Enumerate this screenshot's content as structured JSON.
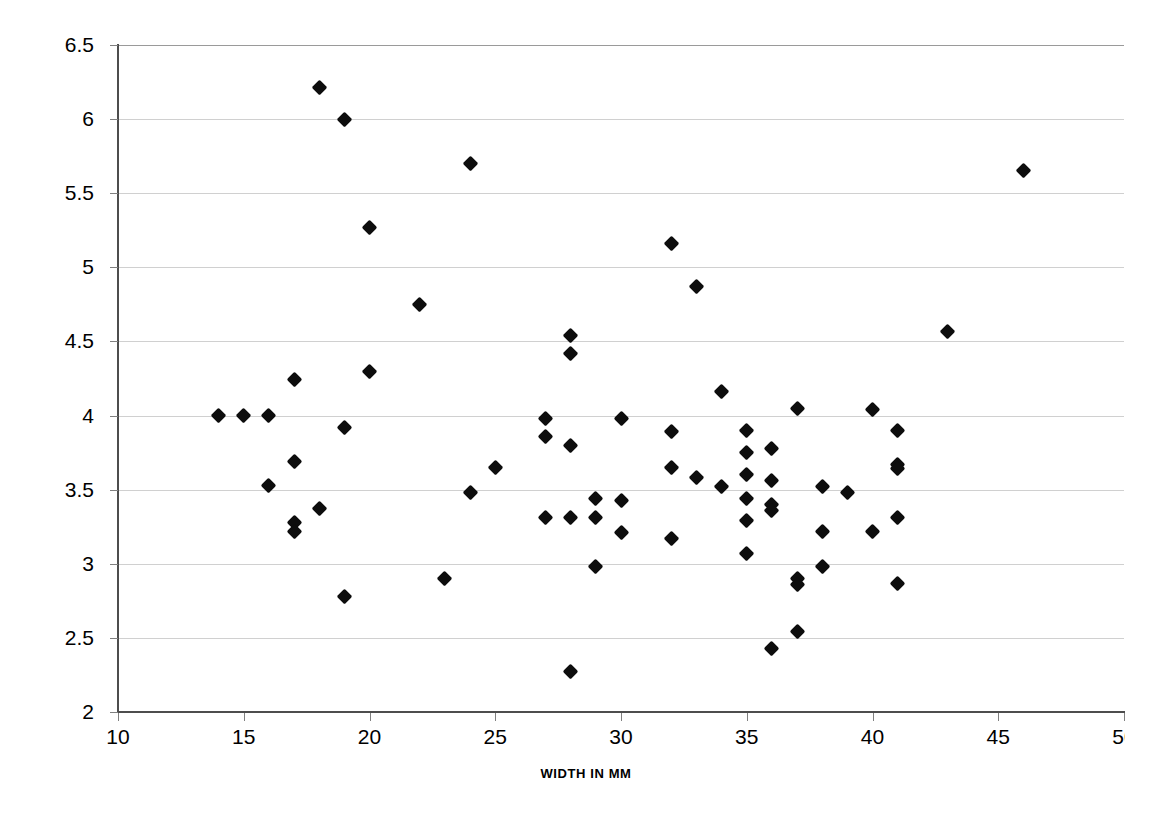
{
  "chart_data": {
    "type": "scatter",
    "title": "",
    "xlabel": "WIDTH IN MM",
    "ylabel": "L/TH RATIO",
    "xlim": [
      10,
      50
    ],
    "ylim": [
      2,
      6.5
    ],
    "xticks": [
      10,
      15,
      20,
      25,
      30,
      35,
      40,
      45,
      50
    ],
    "xtick_labels": [
      "10",
      "15",
      "20",
      "25",
      "30",
      "35",
      "40",
      "45",
      "50"
    ],
    "yticks": [
      2,
      2.5,
      3,
      3.5,
      4,
      4.5,
      5,
      5.5,
      6,
      6.5
    ],
    "ytick_labels": [
      "2",
      "2.5",
      "3",
      "3.5",
      "4",
      "4.5",
      "5",
      "5.5",
      "6",
      "6.5"
    ],
    "grid": "horizontal",
    "legend": "none",
    "marker": "diamond",
    "marker_color": "#0d0d0d",
    "grid_color": "#d0d0d0",
    "axis_color": "#4d4d4d",
    "background": "#ffffff",
    "series": [
      {
        "name": "L/TH ratio vs width",
        "points": [
          [
            14,
            4.0
          ],
          [
            15,
            4.0
          ],
          [
            16,
            4.0
          ],
          [
            16,
            3.53
          ],
          [
            17,
            4.24
          ],
          [
            17,
            3.69
          ],
          [
            17,
            3.28
          ],
          [
            17,
            3.22
          ],
          [
            18,
            6.21
          ],
          [
            18,
            3.37
          ],
          [
            19,
            6.0
          ],
          [
            19,
            3.92
          ],
          [
            19,
            2.78
          ],
          [
            20,
            5.27
          ],
          [
            20,
            4.3
          ],
          [
            22,
            4.75
          ],
          [
            23,
            2.9
          ],
          [
            24,
            5.7
          ],
          [
            24,
            3.48
          ],
          [
            25,
            3.65
          ],
          [
            27,
            3.98
          ],
          [
            27,
            3.86
          ],
          [
            27,
            3.31
          ],
          [
            28,
            4.54
          ],
          [
            28,
            4.42
          ],
          [
            28,
            3.8
          ],
          [
            28,
            3.31
          ],
          [
            28,
            2.27
          ],
          [
            29,
            3.44
          ],
          [
            29,
            3.31
          ],
          [
            29,
            2.98
          ],
          [
            30,
            3.98
          ],
          [
            30,
            3.43
          ],
          [
            30,
            3.21
          ],
          [
            32,
            5.16
          ],
          [
            32,
            3.89
          ],
          [
            32,
            3.65
          ],
          [
            32,
            3.17
          ],
          [
            33,
            4.87
          ],
          [
            33,
            3.58
          ],
          [
            34,
            4.16
          ],
          [
            34,
            3.52
          ],
          [
            35,
            3.9
          ],
          [
            35,
            3.75
          ],
          [
            35,
            3.6
          ],
          [
            35,
            3.44
          ],
          [
            35,
            3.29
          ],
          [
            35,
            3.07
          ],
          [
            36,
            3.78
          ],
          [
            36,
            3.56
          ],
          [
            36,
            3.4
          ],
          [
            36,
            3.36
          ],
          [
            36,
            2.43
          ],
          [
            37,
            4.05
          ],
          [
            37,
            2.9
          ],
          [
            37,
            2.86
          ],
          [
            37,
            2.54
          ],
          [
            38,
            3.52
          ],
          [
            38,
            3.22
          ],
          [
            38,
            2.98
          ],
          [
            39,
            3.48
          ],
          [
            40,
            4.04
          ],
          [
            40,
            3.22
          ],
          [
            41,
            3.9
          ],
          [
            41,
            3.67
          ],
          [
            41,
            3.64
          ],
          [
            41,
            3.31
          ],
          [
            41,
            2.87
          ],
          [
            43,
            4.57
          ],
          [
            46,
            5.65
          ]
        ]
      }
    ]
  }
}
